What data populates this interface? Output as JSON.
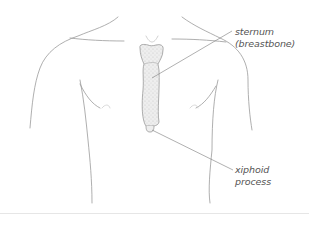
{
  "diagram": {
    "labels": [
      {
        "id": "sternum",
        "lines": [
          "sternum",
          "(breastbone)"
        ]
      },
      {
        "id": "xiphoid",
        "lines": [
          "xiphoid",
          "process"
        ]
      }
    ],
    "colors": {
      "outline": "#9a9a9a",
      "bone_fill": "#ececec",
      "bone_stroke": "#8c8c8c",
      "leader_line": "#7a7a7a",
      "label_text": "#555555",
      "rule": "#e6e6e6"
    }
  }
}
